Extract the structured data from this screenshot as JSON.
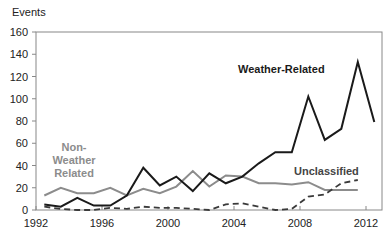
{
  "chart_data": {
    "type": "line",
    "title": "",
    "xlabel": "",
    "ylabel": "Events",
    "ylim": [
      0,
      160
    ],
    "yticks": [
      0,
      20,
      40,
      60,
      80,
      100,
      120,
      140,
      160
    ],
    "xlim": [
      1992,
      2013
    ],
    "xticks": [
      1992,
      1996,
      2000,
      2004,
      2008,
      2012
    ],
    "grid": false,
    "legend": "inline labels",
    "x": [
      1992,
      1993,
      1994,
      1995,
      1996,
      1997,
      1998,
      1999,
      2000,
      2001,
      2002,
      2003,
      2004,
      2005,
      2006,
      2007,
      2008,
      2009,
      2010,
      2011,
      2012
    ],
    "series": [
      {
        "name": "Weather-Related",
        "style": "solid",
        "color": "#1a1a1a",
        "values": [
          5,
          3,
          11,
          4,
          4,
          13,
          38,
          22,
          30,
          17,
          33,
          24,
          30,
          42,
          52,
          52,
          102,
          63,
          73,
          133,
          79
        ]
      },
      {
        "name": "Non-Weather Related",
        "style": "solid",
        "color": "#8c8c8c",
        "values": [
          13,
          20,
          15,
          15,
          20,
          13,
          19,
          15,
          21,
          35,
          21,
          31,
          30,
          24,
          24,
          23,
          25,
          18,
          18,
          18,
          null
        ]
      },
      {
        "name": "Unclassified",
        "style": "dashed",
        "color": "#3a3a3a",
        "values": [
          3,
          1,
          0,
          0,
          2,
          1,
          3,
          2,
          2,
          1,
          0,
          5,
          6,
          3,
          0,
          1,
          12,
          14,
          24,
          27,
          null
        ]
      }
    ],
    "annotations": [
      {
        "text": "Weather-Related",
        "x": 2005.5,
        "y": 125
      },
      {
        "text": "Non-Weather Related",
        "x": 1993.5,
        "y": 55
      },
      {
        "text": "Unclassified",
        "x": 2009,
        "y": 32
      }
    ]
  },
  "labels": {
    "y_axis_title": "Events",
    "weather": "Weather-Related",
    "nonweather_1": "Non-",
    "nonweather_2": "Weather",
    "nonweather_3": "Related",
    "unclassified": "Unclassified"
  }
}
